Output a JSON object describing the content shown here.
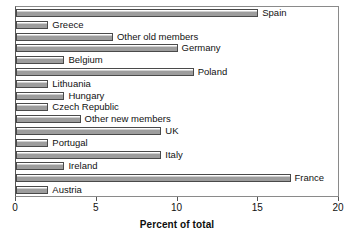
{
  "chart_data": {
    "type": "bar",
    "orientation": "horizontal",
    "title": "",
    "xlabel": "Percent of total",
    "ylabel": "",
    "xlim": [
      0,
      20
    ],
    "xticks": [
      0,
      5,
      10,
      15,
      20
    ],
    "xtick_labels": [
      "0",
      "5",
      "10",
      "15",
      "20"
    ],
    "grid": false,
    "legend": "none",
    "data_labels_position": "outside-end",
    "categories": [
      "Spain",
      "Greece",
      "Other old members",
      "Germany",
      "Belgium",
      "Poland",
      "Lithuania",
      "Hungary",
      "Czech Republic",
      "Other new members",
      "UK",
      "Portugal",
      "Italy",
      "Ireland",
      "France",
      "Austria"
    ],
    "values": [
      15,
      2,
      6,
      10,
      3,
      11,
      2,
      3,
      2,
      4,
      9,
      2,
      9,
      3,
      17,
      2
    ],
    "bars": [
      {
        "label": "Spain",
        "value": 15
      },
      {
        "label": "Greece",
        "value": 2
      },
      {
        "label": "Other old members",
        "value": 6
      },
      {
        "label": "Germany",
        "value": 10
      },
      {
        "label": "Belgium",
        "value": 3
      },
      {
        "label": "Poland",
        "value": 11
      },
      {
        "label": "Lithuania",
        "value": 2
      },
      {
        "label": "Hungary",
        "value": 3
      },
      {
        "label": "Czech Republic",
        "value": 2
      },
      {
        "label": "Other new members",
        "value": 4
      },
      {
        "label": "UK",
        "value": 9
      },
      {
        "label": "Portugal",
        "value": 2
      },
      {
        "label": "Italy",
        "value": 9
      },
      {
        "label": "Ireland",
        "value": 3
      },
      {
        "label": "France",
        "value": 17
      },
      {
        "label": "Austria",
        "value": 2
      }
    ],
    "colors": {
      "bar_fill": "#9d9d9d",
      "bar_border": "#4a4a4a",
      "axis": "#555555",
      "frame": "#8a8a8a",
      "text": "#111111",
      "background": "#ffffff"
    }
  }
}
